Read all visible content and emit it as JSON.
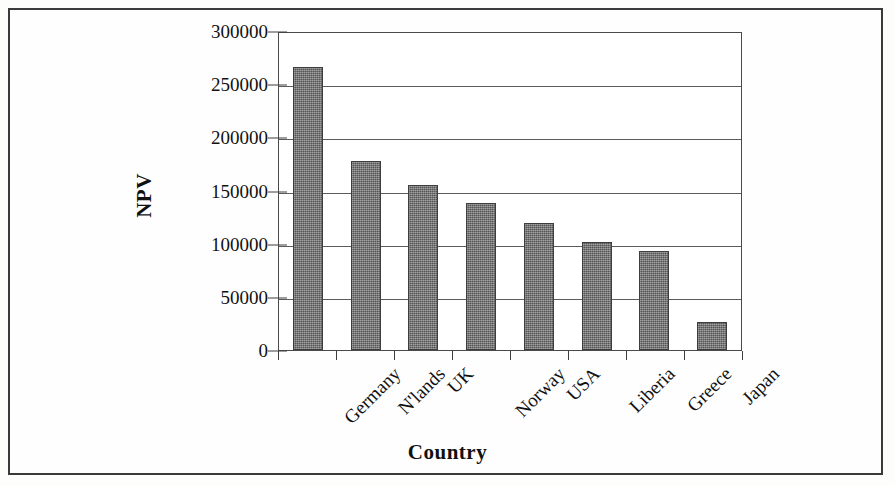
{
  "chart_data": {
    "type": "bar",
    "title": "",
    "xlabel": "Country",
    "ylabel": "NPV",
    "categories": [
      "Germany",
      "N'lands",
      "UK",
      "Norway",
      "USA",
      "Liberia",
      "Greece",
      "Japan"
    ],
    "values": [
      266000,
      177500,
      155000,
      138000,
      119000,
      102000,
      93500,
      26500
    ],
    "ylim": [
      0,
      300000
    ],
    "yticks": [
      0,
      50000,
      100000,
      150000,
      200000,
      250000,
      300000
    ],
    "ytick_labels": [
      "0",
      "50000",
      "100000",
      "150000",
      "200000",
      "250000",
      "300000"
    ],
    "grid": true,
    "legend": false,
    "bar_color": "#6e6e6e",
    "bar_edge_color": "#3d3d3d",
    "axis_color": "#4a4a4a",
    "background_color": "#ffffff"
  }
}
